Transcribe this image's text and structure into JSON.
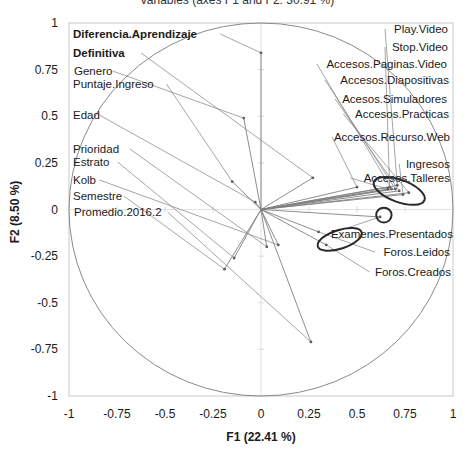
{
  "chart_data": {
    "type": "scatter",
    "subtype": "pca-correlation-circle",
    "title_cropped": "Variables (axes F1 and F2: 30.91 %)",
    "xlabel": "F1 (22.41 %)",
    "ylabel": "F2 (8.50 %)",
    "xlim": [
      -1,
      1
    ],
    "ylim": [
      -1,
      1
    ],
    "xticks": [
      "-1",
      "-0.75",
      "-0.5",
      "-0.25",
      "0",
      "0.25",
      "0.5",
      "0.75",
      "1"
    ],
    "yticks": [
      "1",
      "0.75",
      "0.5",
      "0.25",
      "0",
      "-0.25",
      "-0.5",
      "-0.75",
      "-1"
    ],
    "grid": false,
    "unit_circle": true,
    "points": [
      {
        "name": "Diferencia.Aprendizaje",
        "x": 0.0,
        "y": 0.84,
        "label_x": 73,
        "label_y": 38,
        "bold": true
      },
      {
        "name": "Definitiva",
        "x": 0.27,
        "y": 0.17,
        "label_x": 73,
        "label_y": 57,
        "bold": true
      },
      {
        "name": "Genero",
        "x": -0.09,
        "y": 0.49,
        "label_x": 74,
        "label_y": 75,
        "bold": false
      },
      {
        "name": "Puntaje.Ingreso",
        "x": -0.15,
        "y": 0.15,
        "label_x": 73,
        "label_y": 88,
        "bold": false
      },
      {
        "name": "Edad",
        "x": -0.03,
        "y": 0.04,
        "label_x": 73,
        "label_y": 119,
        "bold": false
      },
      {
        "name": "Prioridad",
        "x": 0.03,
        "y": -0.2,
        "label_x": 73,
        "label_y": 153,
        "bold": false
      },
      {
        "name": "Estrato",
        "x": -0.14,
        "y": -0.26,
        "label_x": 73,
        "label_y": 166,
        "bold": false
      },
      {
        "name": "Kolb",
        "x": 0.09,
        "y": -0.19,
        "label_x": 73,
        "label_y": 184,
        "bold": false
      },
      {
        "name": "Semestre",
        "x": -0.19,
        "y": -0.32,
        "label_x": 73,
        "label_y": 200,
        "bold": false
      },
      {
        "name": "Promedio.2016.2",
        "x": 0.26,
        "y": -0.71,
        "label_x": 74,
        "label_y": 216,
        "bold": false
      },
      {
        "name": "Play.Video",
        "x": 0.71,
        "y": 0.13,
        "label_x": 448,
        "label_y": 33,
        "bold": false,
        "anchor": "end"
      },
      {
        "name": "Stop.Video",
        "x": 0.67,
        "y": 0.12,
        "label_x": 448,
        "label_y": 51,
        "bold": false,
        "anchor": "end"
      },
      {
        "name": "Accesos.Paginas.Video",
        "x": 0.68,
        "y": 0.11,
        "label_x": 447,
        "label_y": 68,
        "bold": false,
        "anchor": "end"
      },
      {
        "name": "Accesos.Diapositivas",
        "x": 0.7,
        "y": 0.11,
        "label_x": 449,
        "label_y": 84,
        "bold": false,
        "anchor": "end"
      },
      {
        "name": "Acesos.Simuladores",
        "x": 0.72,
        "y": 0.1,
        "label_x": 447,
        "label_y": 103,
        "bold": false,
        "anchor": "end"
      },
      {
        "name": "Accesos.Practicas",
        "x": 0.77,
        "y": 0.09,
        "label_x": 449,
        "label_y": 118,
        "bold": false,
        "anchor": "end"
      },
      {
        "name": "Accesos.Recurso.Web",
        "x": 0.5,
        "y": 0.12,
        "label_x": 450,
        "label_y": 141,
        "bold": false,
        "anchor": "end"
      },
      {
        "name": "Ingresos",
        "x": 0.74,
        "y": 0.08,
        "label_x": 450,
        "label_y": 168,
        "bold": false,
        "anchor": "end"
      },
      {
        "name": "Accesos.Talleres",
        "x": 0.66,
        "y": 0.11,
        "label_x": 450,
        "label_y": 182,
        "bold": false,
        "anchor": "end"
      },
      {
        "name": "Examenes.Presentados",
        "x": 0.62,
        "y": -0.04,
        "label_x": 453,
        "label_y": 238,
        "bold": false,
        "anchor": "end"
      },
      {
        "name": "Foros.Leidos",
        "x": 0.3,
        "y": -0.12,
        "label_x": 450,
        "label_y": 256,
        "bold": false,
        "anchor": "end"
      },
      {
        "name": "Foros.Creados",
        "x": 0.34,
        "y": -0.19,
        "label_x": 451,
        "label_y": 276,
        "bold": false,
        "anchor": "end"
      }
    ],
    "annotations": [
      {
        "type": "ellipse",
        "cx": 0.72,
        "cy": 0.1,
        "rx": 0.14,
        "ry": 0.06,
        "rotation": 20,
        "note": "hand-drawn ellipse around access/video cluster"
      },
      {
        "type": "ellipse",
        "cx": 0.64,
        "cy": -0.03,
        "rx": 0.04,
        "ry": 0.04,
        "rotation": 0,
        "note": "small circle near Examenes.Presentados"
      },
      {
        "type": "ellipse",
        "cx": 0.41,
        "cy": -0.16,
        "rx": 0.12,
        "ry": 0.05,
        "rotation": -18,
        "note": "hand-drawn ellipse around Foros variables"
      }
    ]
  },
  "plot": {
    "frame": {
      "left": 69,
      "top": 23,
      "right": 453,
      "bottom": 396
    },
    "colors": {
      "vector": "#808080",
      "circle": "#8a8a8a",
      "frame": "#c8c8c8",
      "annotation": "#2a2a2a",
      "text": "#1a1a1a"
    }
  }
}
